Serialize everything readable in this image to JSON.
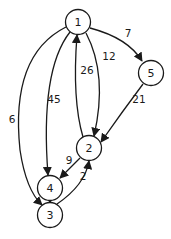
{
  "diagram": {
    "type": "directed-weighted-graph",
    "nodes": [
      {
        "id": "1",
        "label": "1"
      },
      {
        "id": "5",
        "label": "5"
      },
      {
        "id": "2",
        "label": "2"
      },
      {
        "id": "4",
        "label": "4"
      },
      {
        "id": "3",
        "label": "3"
      }
    ],
    "edges": [
      {
        "from": "1",
        "to": "5",
        "weight": "7"
      },
      {
        "from": "1",
        "to": "2",
        "weight": "12"
      },
      {
        "from": "2",
        "to": "1",
        "weight": "26"
      },
      {
        "from": "1",
        "to": "4",
        "weight": "45"
      },
      {
        "from": "1",
        "to": "3",
        "weight": "6"
      },
      {
        "from": "5",
        "to": "2",
        "weight": "21"
      },
      {
        "from": "2",
        "to": "4",
        "weight": "9"
      },
      {
        "from": "4",
        "to": "3",
        "weight": "8"
      },
      {
        "from": "3",
        "to": "2",
        "weight": "2"
      }
    ]
  }
}
